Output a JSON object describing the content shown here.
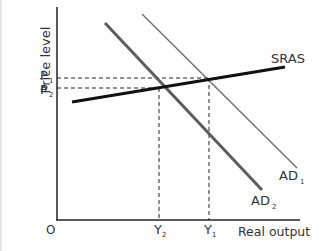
{
  "diagram": {
    "type": "economics-ad-as",
    "axes": {
      "y_label": "Price level",
      "x_label": "Real output",
      "origin_label": "O"
    },
    "curves": {
      "sras": {
        "label": "SRAS",
        "color": "#111111"
      },
      "ad1": {
        "label": "AD",
        "subscript": "1",
        "color": "#666666"
      },
      "ad2": {
        "label": "AD",
        "subscript": "2",
        "color": "#5a5a5a"
      }
    },
    "price_levels": [
      {
        "label": "P",
        "subscript": "1"
      },
      {
        "label": "P",
        "subscript": "2"
      }
    ],
    "output_levels": [
      {
        "label": "Y",
        "subscript": "2"
      },
      {
        "label": "Y",
        "subscript": "1"
      }
    ]
  }
}
